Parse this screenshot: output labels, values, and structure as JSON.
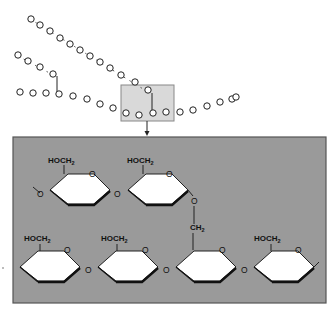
{
  "figure": {
    "type": "glycogen / amylopectin branching diagram",
    "overview": {
      "description": "Branched chains of glucose residues shown as loops",
      "chains": [
        {
          "name": "upper-branch-chain",
          "units": 12
        },
        {
          "name": "short-branch-chain",
          "units": 4
        },
        {
          "name": "main-chain",
          "units": 18
        }
      ],
      "highlight_box": {
        "label": "branch point region",
        "fill": "#d9d9d9",
        "stroke": "#888888"
      }
    },
    "detail_panel": {
      "fill": "#9a9a9a",
      "border": "#555555",
      "ring_fill": "#ffffff",
      "top_row": [
        {
          "group": "HOCH",
          "subscript": "2",
          "ring_oxygen": "O",
          "link_oxygen": "O"
        },
        {
          "group": "HOCH",
          "subscript": "2",
          "ring_oxygen": "O",
          "link_oxygen": "O"
        }
      ],
      "branch_link": {
        "group": "CH",
        "subscript": "2"
      },
      "bottom_row": [
        {
          "group": "HOCH",
          "subscript": "2",
          "ring_oxygen": "O",
          "link_oxygen": "O"
        },
        {
          "group": "HOCH",
          "subscript": "2",
          "ring_oxygen": "O",
          "link_oxygen": "O"
        },
        {
          "group": "CH",
          "subscript": "2",
          "ring_oxygen": "O",
          "link_oxygen": "O"
        },
        {
          "group": "HOCH",
          "subscript": "2",
          "ring_oxygen": "O",
          "link_oxygen": ""
        }
      ]
    },
    "labels": {
      "hoch": "HOCH",
      "ch": "CH",
      "sub2": "2",
      "o": "O"
    }
  }
}
